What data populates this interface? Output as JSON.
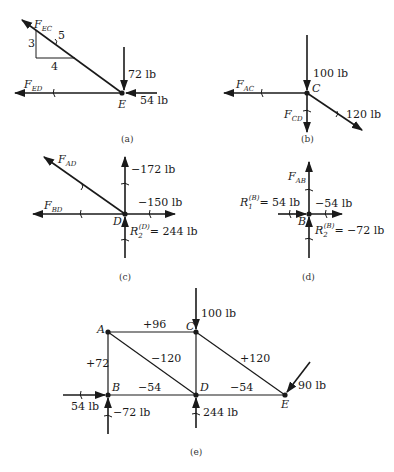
{
  "panels": {
    "a": {
      "caption": "(a)",
      "joint": "E",
      "forces": {
        "F_EC": {
          "sym": "F",
          "sub": "EC"
        },
        "F_ED": {
          "sym": "F",
          "sub": "ED"
        },
        "load_vertical": "72 lb",
        "load_horizontal": "54 lb"
      },
      "slope_triangle": {
        "rise": "3",
        "run": "4",
        "hyp": "5"
      }
    },
    "b": {
      "caption": "(b)",
      "joint": "C",
      "forces": {
        "F_AC": {
          "sym": "F",
          "sub": "AC"
        },
        "F_CD": {
          "sym": "F",
          "sub": "CD"
        },
        "load_vertical": "100 lb",
        "member_CE": "120 lb"
      }
    },
    "c": {
      "caption": "(c)",
      "joint": "D",
      "forces": {
        "F_AD": {
          "sym": "F",
          "sub": "AD"
        },
        "F_BD": {
          "sym": "F",
          "sub": "BD"
        },
        "vertical_result": "−172 lb",
        "horizontal_result": "−150 lb",
        "reaction": {
          "sym": "R",
          "sub": "2",
          "sup": "(D)",
          "value": "= 244 lb"
        }
      }
    },
    "d": {
      "caption": "(d)",
      "joint": "B",
      "forces": {
        "F_AB": {
          "sym": "F",
          "sub": "AB"
        },
        "reaction_1": {
          "sym": "R",
          "sub": "1",
          "sup": "(B)",
          "value": "= 54 lb"
        },
        "horizontal_result": "−54 lb",
        "reaction_2": {
          "sym": "R",
          "sub": "2",
          "sup": "(B)",
          "value": "= −72 lb"
        }
      }
    },
    "e": {
      "caption": "(e)",
      "joints": [
        "A",
        "B",
        "C",
        "D",
        "E"
      ],
      "members": {
        "AC": "+96",
        "AB": "+72",
        "AD": "−120",
        "BD": "−54",
        "DE": "−54",
        "CE": "+120"
      },
      "loads": {
        "C": "100 lb",
        "E": "90 lb",
        "B_horizontal": "54 lb",
        "B_vertical": "−72 lb",
        "D_vertical": "244 lb"
      }
    }
  }
}
